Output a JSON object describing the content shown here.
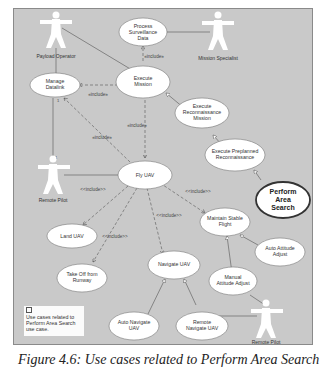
{
  "diagram": {
    "type": "uml-use-case",
    "actors": [
      {
        "id": "payload_operator",
        "label": "Payload Operator"
      },
      {
        "id": "mission_specialist",
        "label": "Mission Specialist"
      },
      {
        "id": "remote_pilot_1",
        "label": "Remote Pilot"
      },
      {
        "id": "remote_pilot_2",
        "label": "Remote Pilot"
      }
    ],
    "use_cases": [
      {
        "id": "process_surveillance",
        "lines": [
          "Process",
          "Surveillance",
          "Data"
        ]
      },
      {
        "id": "manage_datalink",
        "lines": [
          "Manage",
          "Datalink"
        ]
      },
      {
        "id": "execute_mission",
        "lines": [
          "Execute",
          "Mission"
        ]
      },
      {
        "id": "execute_recon_mission",
        "lines": [
          "Execute",
          "Reconnaissance",
          "Mission"
        ]
      },
      {
        "id": "execute_preplanned_recon",
        "lines": [
          "Execute Preplanned",
          "Reconnaissance"
        ]
      },
      {
        "id": "perform_area_search",
        "lines": [
          "Perform",
          "Area",
          "Search"
        ],
        "highlighted": true
      },
      {
        "id": "fly_uav",
        "lines": [
          "Fly UAV"
        ]
      },
      {
        "id": "land_uav",
        "lines": [
          "Land UAV"
        ]
      },
      {
        "id": "take_off_runway",
        "lines": [
          "Take Off from",
          "Runway"
        ]
      },
      {
        "id": "navigate_uav",
        "lines": [
          "Navigate UAV"
        ]
      },
      {
        "id": "maintain_stable_flight",
        "lines": [
          "Maintain Stable",
          "Flight"
        ]
      },
      {
        "id": "auto_attitude_adjust",
        "lines": [
          "Auto Attitude",
          "Adjust"
        ]
      },
      {
        "id": "manual_attitude_adjust",
        "lines": [
          "Manual",
          "Attitude Adjust"
        ]
      },
      {
        "id": "auto_navigate_uav",
        "lines": [
          "Auto Navigate",
          "UAV"
        ]
      },
      {
        "id": "remote_navigate_uav",
        "lines": [
          "Remote",
          "Navigate UAV"
        ]
      }
    ],
    "relationship_labels": {
      "include_a": "«include»",
      "include_b": "<<include>>"
    },
    "relationships": [
      {
        "from": "execute_mission",
        "to": "process_surveillance",
        "kind": "include",
        "label": "«include»"
      },
      {
        "from": "execute_mission",
        "to": "manage_datalink",
        "kind": "include",
        "label": "«include»"
      },
      {
        "from": "execute_mission",
        "to": "fly_uav",
        "kind": "include",
        "label": "«include»"
      },
      {
        "from": "fly_uav",
        "to": "manage_datalink",
        "kind": "include",
        "label": "«include»"
      },
      {
        "from": "fly_uav",
        "to": "land_uav",
        "kind": "include",
        "label": "<<include>>"
      },
      {
        "from": "fly_uav",
        "to": "take_off_runway",
        "kind": "include",
        "label": "<<include>>"
      },
      {
        "from": "fly_uav",
        "to": "navigate_uav",
        "kind": "include",
        "label": "<<include>>"
      },
      {
        "from": "fly_uav",
        "to": "maintain_stable_flight",
        "kind": "include",
        "label": "<<include>>"
      },
      {
        "from": "execute_recon_mission",
        "to": "execute_mission",
        "kind": "generalization"
      },
      {
        "from": "execute_preplanned_recon",
        "to": "execute_recon_mission",
        "kind": "generalization"
      },
      {
        "from": "perform_area_search",
        "to": "execute_preplanned_recon",
        "kind": "generalization"
      },
      {
        "from": "auto_attitude_adjust",
        "to": "maintain_stable_flight",
        "kind": "generalization"
      },
      {
        "from": "manual_attitude_adjust",
        "to": "maintain_stable_flight",
        "kind": "generalization"
      },
      {
        "from": "auto_navigate_uav",
        "to": "navigate_uav",
        "kind": "generalization"
      },
      {
        "from": "remote_navigate_uav",
        "to": "navigate_uav",
        "kind": "generalization"
      },
      {
        "from": "payload_operator",
        "to": "manage_datalink",
        "kind": "association"
      },
      {
        "from": "payload_operator",
        "to": "execute_mission",
        "kind": "association"
      },
      {
        "from": "mission_specialist",
        "to": "process_surveillance",
        "kind": "association"
      },
      {
        "from": "remote_pilot_1",
        "to": "manage_datalink",
        "kind": "association"
      },
      {
        "from": "remote_pilot_1",
        "to": "fly_uav",
        "kind": "association"
      },
      {
        "from": "remote_pilot_2",
        "to": "manual_attitude_adjust",
        "kind": "association"
      },
      {
        "from": "remote_pilot_2",
        "to": "remote_navigate_uav",
        "kind": "association"
      }
    ],
    "multiplicities": {
      "one": "1"
    },
    "note": {
      "text": "Use cases related to Perform Area Search use case."
    }
  },
  "caption": "Figure 4.6: Use cases related to Perform Area Search"
}
